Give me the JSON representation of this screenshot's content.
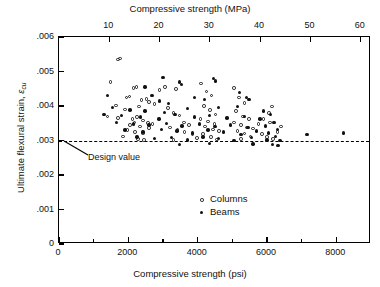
{
  "chart_data": {
    "type": "scatter",
    "title": "",
    "xlabel": "Compressive strength (psi)",
    "xlabel_top": "Compressive strength (MPa)",
    "ylabel": "Ultimate flexural strain, εcu",
    "ylabel_symbol": "ε",
    "ylabel_subscript": "cu",
    "ylabel_prefix": "Ultimate flexural strain, ",
    "xlim": [
      0,
      9000
    ],
    "ylim": [
      0,
      0.006
    ],
    "xlim_top_mpa": [
      0,
      62.05
    ],
    "grid": false,
    "legend_position": "inside-lower-right",
    "x_ticks": [
      0,
      2000,
      4000,
      6000,
      8000
    ],
    "x_tick_labels": [
      "0",
      "2000",
      "4000",
      "6000",
      "8000"
    ],
    "x_minor_ticks": [
      1000,
      3000,
      5000,
      7000
    ],
    "x_top_ticks": [
      10,
      20,
      30,
      40,
      50,
      60
    ],
    "x_top_tick_labels": [
      "10",
      "20",
      "30",
      "40",
      "50",
      "60"
    ],
    "y_ticks": [
      0,
      0.001,
      0.002,
      0.003,
      0.004,
      0.005,
      0.006
    ],
    "y_tick_labels": [
      "0",
      ".001",
      ".002",
      ".003",
      ".004",
      ".005",
      ".006"
    ],
    "annotations": [
      {
        "text": "Design value",
        "x": 900,
        "y": 0.0025,
        "line_y": 0.003
      }
    ],
    "reference_lines": [
      {
        "name": "design-value",
        "axis": "y",
        "value": 0.003,
        "style": "dashed"
      }
    ],
    "legend": [
      {
        "label": "Columns",
        "marker": "open-circle"
      },
      {
        "label": "Beams",
        "marker": "filled-circle"
      }
    ],
    "series": [
      {
        "name": "Columns",
        "marker": "open-circle",
        "points": [
          [
            1700,
            0.00535
          ],
          [
            1760,
            0.00538
          ],
          [
            1480,
            0.0047
          ],
          [
            2150,
            0.00452
          ],
          [
            2230,
            0.00455
          ],
          [
            2900,
            0.00447
          ],
          [
            3380,
            0.0045
          ],
          [
            1950,
            0.00425
          ],
          [
            2030,
            0.00428
          ],
          [
            1640,
            0.00402
          ],
          [
            1900,
            0.0039
          ],
          [
            2380,
            0.00418
          ],
          [
            2520,
            0.0042
          ],
          [
            2600,
            0.00412
          ],
          [
            2300,
            0.00398
          ],
          [
            2760,
            0.00405
          ],
          [
            1400,
            0.0037
          ],
          [
            1700,
            0.00365
          ],
          [
            2120,
            0.00362
          ],
          [
            2250,
            0.00368
          ],
          [
            2180,
            0.00352
          ],
          [
            2420,
            0.00358
          ],
          [
            2560,
            0.0035
          ],
          [
            2050,
            0.00345
          ],
          [
            2330,
            0.0034
          ],
          [
            2600,
            0.00336
          ],
          [
            2700,
            0.00348
          ],
          [
            1980,
            0.0033
          ],
          [
            2200,
            0.00325
          ],
          [
            2420,
            0.0032
          ],
          [
            1850,
            0.00312
          ],
          [
            2280,
            0.00305
          ],
          [
            2460,
            0.00302
          ],
          [
            3050,
            0.00455
          ],
          [
            3150,
            0.00395
          ],
          [
            3300,
            0.0038
          ],
          [
            3480,
            0.00372
          ],
          [
            3600,
            0.00352
          ],
          [
            3750,
            0.00345
          ],
          [
            3200,
            0.00338
          ],
          [
            3420,
            0.0033
          ],
          [
            3620,
            0.00325
          ],
          [
            3850,
            0.00318
          ],
          [
            3980,
            0.00308
          ],
          [
            3300,
            0.00302
          ],
          [
            4100,
            0.00465
          ],
          [
            4250,
            0.00442
          ],
          [
            4400,
            0.0043
          ],
          [
            4180,
            0.004
          ],
          [
            4350,
            0.00388
          ],
          [
            4520,
            0.00375
          ],
          [
            4080,
            0.00362
          ],
          [
            4300,
            0.00355
          ],
          [
            4480,
            0.00348
          ],
          [
            4220,
            0.0034
          ],
          [
            4450,
            0.00332
          ],
          [
            4620,
            0.00328
          ],
          [
            4150,
            0.00318
          ],
          [
            4380,
            0.0031
          ],
          [
            4560,
            0.00303
          ],
          [
            5050,
            0.00452
          ],
          [
            5200,
            0.00425
          ],
          [
            5350,
            0.00408
          ],
          [
            5100,
            0.00385
          ],
          [
            5300,
            0.0037
          ],
          [
            5480,
            0.00362
          ],
          [
            5050,
            0.00352
          ],
          [
            5250,
            0.00345
          ],
          [
            5420,
            0.00338
          ],
          [
            5150,
            0.00328
          ],
          [
            5350,
            0.0032
          ],
          [
            5520,
            0.00312
          ],
          [
            5250,
            0.00305
          ],
          [
            5600,
            0.00335
          ],
          [
            5750,
            0.00348
          ],
          [
            5900,
            0.00362
          ],
          [
            6050,
            0.0038
          ],
          [
            6150,
            0.00398
          ],
          [
            5850,
            0.00318
          ],
          [
            6000,
            0.0031
          ],
          [
            6180,
            0.00305
          ],
          [
            6300,
            0.00325
          ],
          [
            6400,
            0.0034
          ],
          [
            6080,
            0.00352
          ]
        ]
      },
      {
        "name": "Beams",
        "marker": "filled-circle",
        "points": [
          [
            3000,
            0.00482
          ],
          [
            3480,
            0.0047
          ],
          [
            3540,
            0.00462
          ],
          [
            2480,
            0.00455
          ],
          [
            4450,
            0.0048
          ],
          [
            4520,
            0.00472
          ],
          [
            1400,
            0.0043
          ],
          [
            2680,
            0.0043
          ],
          [
            3900,
            0.00425
          ],
          [
            5200,
            0.0044
          ],
          [
            2900,
            0.00415
          ],
          [
            3150,
            0.00408
          ],
          [
            4200,
            0.00418
          ],
          [
            5400,
            0.00425
          ],
          [
            5480,
            0.00418
          ],
          [
            1550,
            0.00395
          ],
          [
            2050,
            0.00388
          ],
          [
            2480,
            0.00385
          ],
          [
            3050,
            0.00382
          ],
          [
            3700,
            0.00392
          ],
          [
            4600,
            0.00395
          ],
          [
            5150,
            0.00398
          ],
          [
            5900,
            0.00385
          ],
          [
            1300,
            0.00375
          ],
          [
            1800,
            0.00372
          ],
          [
            2350,
            0.00368
          ],
          [
            2880,
            0.00362
          ],
          [
            3350,
            0.00375
          ],
          [
            3900,
            0.00368
          ],
          [
            4350,
            0.00372
          ],
          [
            4850,
            0.00365
          ],
          [
            5350,
            0.0037
          ],
          [
            5800,
            0.00362
          ],
          [
            6100,
            0.00375
          ],
          [
            1650,
            0.00352
          ],
          [
            2150,
            0.00348
          ],
          [
            2600,
            0.00345
          ],
          [
            3100,
            0.0035
          ],
          [
            3550,
            0.00342
          ],
          [
            4050,
            0.00348
          ],
          [
            4500,
            0.0034
          ],
          [
            4950,
            0.00345
          ],
          [
            5450,
            0.00338
          ],
          [
            5950,
            0.00342
          ],
          [
            6200,
            0.00352
          ],
          [
            1900,
            0.0033
          ],
          [
            2420,
            0.00325
          ],
          [
            2950,
            0.00332
          ],
          [
            3400,
            0.00328
          ],
          [
            3850,
            0.00322
          ],
          [
            4300,
            0.0033
          ],
          [
            4750,
            0.00325
          ],
          [
            5250,
            0.00318
          ],
          [
            5700,
            0.00328
          ],
          [
            6050,
            0.00322
          ],
          [
            6300,
            0.00332
          ],
          [
            2250,
            0.0031
          ],
          [
            2750,
            0.00305
          ],
          [
            3250,
            0.00308
          ],
          [
            3700,
            0.00302
          ],
          [
            4150,
            0.0031
          ],
          [
            4600,
            0.00305
          ],
          [
            5050,
            0.003
          ],
          [
            5550,
            0.00308
          ],
          [
            6000,
            0.00302
          ],
          [
            6250,
            0.00312
          ],
          [
            6380,
            0.003
          ],
          [
            3480,
            0.00288
          ],
          [
            4350,
            0.00292
          ],
          [
            5600,
            0.0029
          ],
          [
            6150,
            0.00288
          ],
          [
            6320,
            0.00285
          ],
          [
            7150,
            0.00318
          ],
          [
            8200,
            0.00322
          ]
        ]
      }
    ]
  }
}
